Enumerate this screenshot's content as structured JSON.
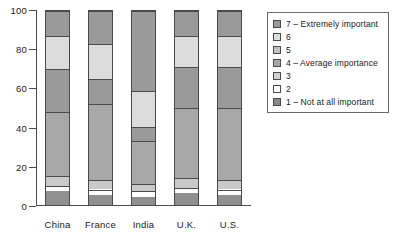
{
  "chart_data": {
    "type": "bar",
    "subtype": "stacked-bar-100",
    "title": "",
    "xlabel": "",
    "ylabel": "",
    "ylim": [
      0,
      100
    ],
    "y_ticks": [
      0,
      20,
      40,
      60,
      80,
      100
    ],
    "grid": false,
    "legend_position": "right",
    "categories": [
      "China",
      "France",
      "India",
      "U.K.",
      "U.S."
    ],
    "series": [
      {
        "name": "1 – Not at all important",
        "color": "#8f8f8f",
        "values": [
          7,
          5,
          4,
          6,
          5
        ]
      },
      {
        "name": "2",
        "color": "#ffffff",
        "values": [
          3,
          3,
          3,
          3,
          3
        ]
      },
      {
        "name": "3",
        "color": "#c9c9c9",
        "values": [
          5,
          5,
          4,
          5,
          5
        ]
      },
      {
        "name": "4 – Average importance",
        "color": "#a8a8a8",
        "values": [
          33,
          39,
          22,
          36,
          37
        ]
      },
      {
        "name": "5",
        "color": "#9a9a9a",
        "values": [
          22,
          13,
          7,
          21,
          21
        ]
      },
      {
        "name": "6",
        "color": "#dcdcdc",
        "values": [
          17,
          18,
          19,
          16,
          16
        ]
      },
      {
        "name": "7 – Extremely important",
        "color": "#9a9a9a",
        "values": [
          13,
          17,
          41,
          13,
          13
        ]
      }
    ],
    "legend_entries": [
      {
        "label": "7 – Extremely important",
        "color": "#9a9a9a"
      },
      {
        "label": "6",
        "color": "#dcdcdc"
      },
      {
        "label": "5",
        "color": "#c2c2c2"
      },
      {
        "label": "4 – Average importance",
        "color": "#a8a8a8"
      },
      {
        "label": "3",
        "color": "#cfcfcf"
      },
      {
        "label": "2",
        "color": "#ffffff"
      },
      {
        "label": "1 – Not at all important",
        "color": "#8a8a8a"
      }
    ]
  },
  "axis": {
    "y_tick_labels": [
      "100",
      "80",
      "60",
      "40",
      "20",
      "0"
    ]
  }
}
